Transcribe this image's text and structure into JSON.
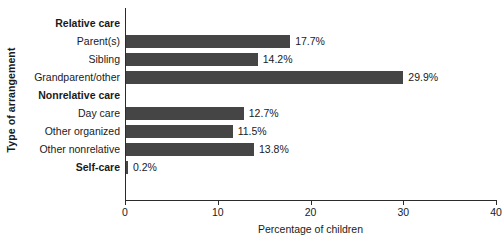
{
  "chart_data": {
    "type": "bar",
    "orientation": "horizontal",
    "title": "",
    "xlabel": "Percentage of children",
    "ylabel": "Type of arrangement",
    "xlim": [
      0,
      40
    ],
    "xticks": [
      0,
      10,
      20,
      30,
      40
    ],
    "xtick_labels": [
      "0",
      "10",
      "20",
      "30",
      "40"
    ],
    "grid": false,
    "legend": "none",
    "bar_color": "#454545",
    "axis_color": "#2b2b2b",
    "value_suffix": "%",
    "rows": [
      {
        "label": "Relative care",
        "is_group": true,
        "value": null,
        "value_label": ""
      },
      {
        "label": "Parent(s)",
        "is_group": false,
        "value": 17.7,
        "value_label": "17.7%"
      },
      {
        "label": "Sibling",
        "is_group": false,
        "value": 14.2,
        "value_label": "14.2%"
      },
      {
        "label": "Grandparent/other",
        "is_group": false,
        "value": 29.9,
        "value_label": "29.9%"
      },
      {
        "label": "Nonrelative care",
        "is_group": true,
        "value": null,
        "value_label": ""
      },
      {
        "label": "Day care",
        "is_group": false,
        "value": 12.7,
        "value_label": "12.7%"
      },
      {
        "label": "Other organized",
        "is_group": false,
        "value": 11.5,
        "value_label": "11.5%"
      },
      {
        "label": "Other nonrelative",
        "is_group": false,
        "value": 13.8,
        "value_label": "13.8%"
      },
      {
        "label": "Self-care",
        "is_group": true,
        "value": 0.2,
        "value_label": "0.2%"
      }
    ],
    "categories": [
      "Parent(s)",
      "Sibling",
      "Grandparent/other",
      "Day care",
      "Other organized",
      "Other nonrelative",
      "Self-care"
    ],
    "values": [
      17.7,
      14.2,
      29.9,
      12.7,
      11.5,
      13.8,
      0.2
    ]
  }
}
